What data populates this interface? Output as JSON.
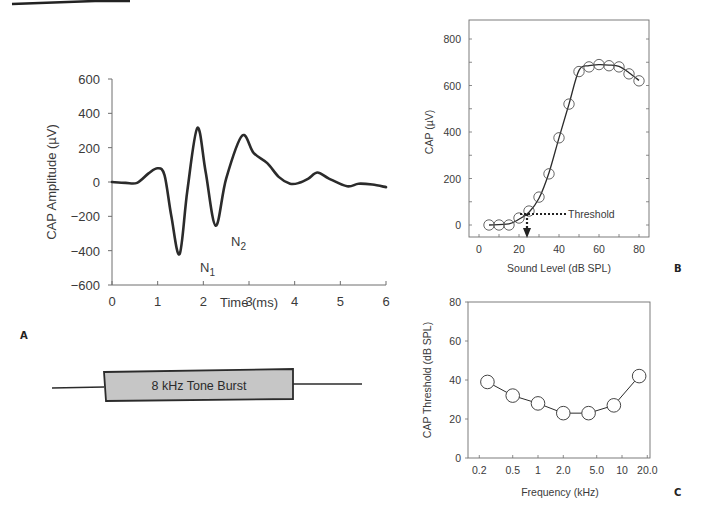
{
  "chart_data": [
    {
      "panel": "A",
      "type": "line",
      "title": "",
      "xlabel": "Time (ms)",
      "ylabel": "CAP Amplitude (µV)",
      "xlim": [
        0,
        6
      ],
      "ylim": [
        -600,
        600
      ],
      "x_ticks": [
        "0",
        "1",
        "2",
        "3",
        "4",
        "5",
        "6"
      ],
      "y_ticks": [
        "600",
        "400",
        "200",
        "0",
        "−200",
        "−400",
        "−600"
      ],
      "grid": false,
      "series": [
        {
          "name": "CAP waveform",
          "x": [
            0,
            0.3,
            0.55,
            0.8,
            1.0,
            1.15,
            1.3,
            1.48,
            1.65,
            1.87,
            2.05,
            2.27,
            2.5,
            2.85,
            3.1,
            3.4,
            3.65,
            3.9,
            4.1,
            4.3,
            4.5,
            4.75,
            5.15,
            5.4,
            5.7,
            6.0
          ],
          "values": [
            0,
            -5,
            -5,
            50,
            80,
            40,
            -200,
            -420,
            -50,
            315,
            60,
            -255,
            20,
            270,
            170,
            110,
            30,
            -10,
            -5,
            20,
            55,
            20,
            -25,
            -10,
            -15,
            -30
          ]
        }
      ],
      "annotations": [
        {
          "text": "N",
          "subscript": "1",
          "x": 1.78,
          "y": -500
        },
        {
          "text": "N",
          "subscript": "2",
          "x": 2.6,
          "y": -350
        }
      ],
      "panel_letter": "A"
    },
    {
      "panel": "stimulus",
      "type": "diagram",
      "label": "8 kHz Tone Burst"
    },
    {
      "panel": "B",
      "type": "line",
      "title": "",
      "xlabel": "Sound Level (dB SPL)",
      "ylabel": "CAP (µV)",
      "xlim": [
        -5,
        85
      ],
      "ylim": [
        -50,
        880
      ],
      "x_ticks": [
        "0",
        "20",
        "40",
        "60",
        "80"
      ],
      "y_ticks": [
        "0",
        "200",
        "400",
        "600",
        "800"
      ],
      "grid": false,
      "series": [
        {
          "name": "CAP input-output",
          "x": [
            5,
            10,
            15,
            20,
            25,
            30,
            35,
            40,
            45,
            50,
            55,
            60,
            65,
            70,
            75,
            80
          ],
          "values": [
            0,
            0,
            0,
            30,
            60,
            120,
            220,
            375,
            520,
            660,
            680,
            690,
            685,
            680,
            650,
            620
          ]
        }
      ],
      "annotations": [
        {
          "text": "Threshold",
          "x": 24,
          "y": 45,
          "arrow": "down to x-axis"
        }
      ],
      "panel_letter": "B"
    },
    {
      "panel": "C",
      "type": "line",
      "title": "",
      "xlabel": "Frequency (kHz)",
      "ylabel": "CAP Threshold (dB SPL)",
      "xscale": "log",
      "xlim": [
        0.17,
        22
      ],
      "ylim": [
        0,
        80
      ],
      "x_ticks": [
        "0.2",
        "0.5",
        "1",
        "2.0",
        "5.0",
        "10",
        "20.0"
      ],
      "y_ticks": [
        "0",
        "20",
        "40",
        "60",
        "80"
      ],
      "grid": false,
      "series": [
        {
          "name": "CAP threshold",
          "x": [
            0.25,
            0.5,
            1,
            2,
            4,
            8,
            16
          ],
          "values": [
            39,
            32,
            28,
            23,
            23,
            27,
            42
          ]
        }
      ],
      "panel_letter": "C"
    }
  ],
  "labels": {
    "a_xlabel": "Time (ms)",
    "a_ylabel": "CAP Amplitude (µV)",
    "a_letter": "A",
    "n1": "N",
    "n1_sub": "1",
    "n2": "N",
    "n2_sub": "2",
    "tone_burst": "8 kHz Tone Burst",
    "b_xlabel": "Sound Level (dB SPL)",
    "b_ylabel": "CAP (µV)",
    "b_letter": "B",
    "threshold": "Threshold",
    "c_xlabel": "Frequency (kHz)",
    "c_ylabel": "CAP Threshold (dB SPL)",
    "c_letter": "C"
  },
  "colors": {
    "ink": "#2b2b2b",
    "axis": "#6e6e6e",
    "tone_fill": "#c6c6c6"
  }
}
